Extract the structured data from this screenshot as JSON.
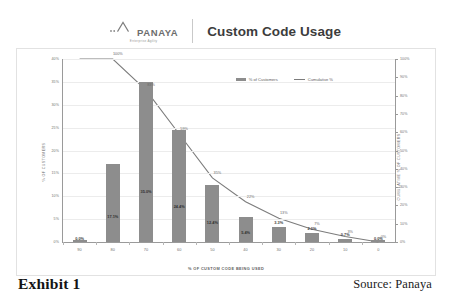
{
  "header": {
    "logo_name": "PANAYA",
    "logo_tagline": "Enterprise Agility",
    "logo_icon": "panaya-mountain-logo-icon",
    "title": "Custom Code Usage"
  },
  "footer": {
    "exhibit_label": "Exhibit 1",
    "source_label": "Source: Panaya"
  },
  "chart_data": {
    "type": "bar",
    "title": "Custom Code Usage",
    "xlabel": "% OF CUSTOM CODE BEING USED",
    "ylabel": "% OF CUSTOMERS",
    "y2label": "CUMULATIVE % OF CUSTOMERS",
    "categories": [
      "90",
      "80",
      "70",
      "60",
      "50",
      "40",
      "30",
      "20",
      "10",
      "0"
    ],
    "ylim": [
      0,
      40
    ],
    "y2lim": [
      0,
      100
    ],
    "yticks": [
      "0%",
      "5%",
      "10%",
      "15%",
      "20%",
      "25%",
      "30%",
      "35%",
      "40%"
    ],
    "y2ticks": [
      "0%",
      "10%",
      "20%",
      "30%",
      "40%",
      "50%",
      "60%",
      "70%",
      "80%",
      "90%",
      "100%"
    ],
    "grid": true,
    "legend_position": "top-right",
    "series": [
      {
        "name": "% of Customers",
        "type": "bar",
        "color": "#8d8d8d",
        "values": [
          0.0,
          17.1,
          35.0,
          24.4,
          12.4,
          5.4,
          3.3,
          2.0,
          0.7,
          0.0
        ],
        "labels": [
          "0.0%",
          "17.1%",
          "35.0%",
          "24.4%",
          "12.4%",
          "5.4%",
          "3.3%",
          "2.0%",
          "0.7%",
          "0.0%"
        ]
      },
      {
        "name": "Cumulative %",
        "type": "line",
        "color": "#7c7c7c",
        "values": [
          100,
          100,
          83,
          59,
          35,
          22,
          13,
          7,
          3,
          0
        ],
        "labels": [
          "",
          "100%",
          "83%",
          "59%",
          "35%",
          "22%",
          "13%",
          "7%",
          "3%",
          "0%"
        ]
      }
    ]
  }
}
